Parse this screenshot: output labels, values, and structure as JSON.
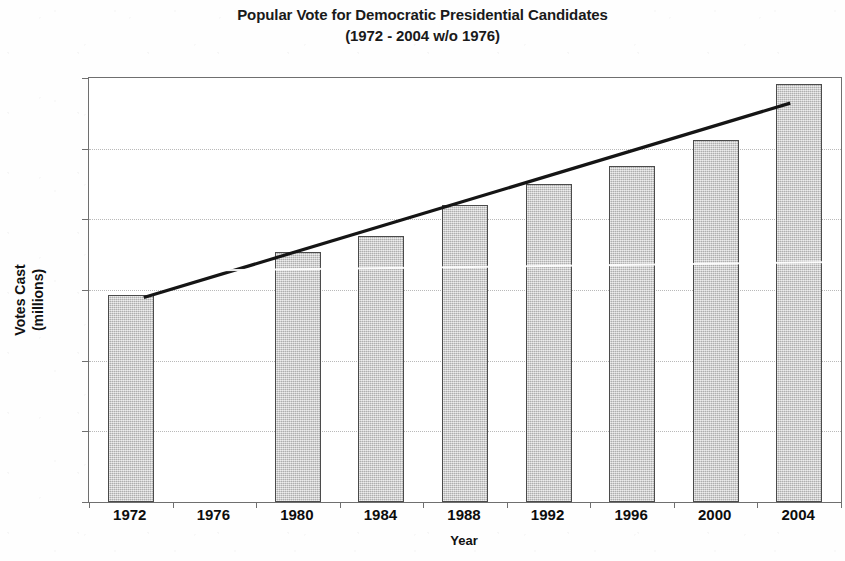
{
  "chart_data": {
    "type": "bar",
    "title": "Popular Vote for Democratic Presidential Candidates",
    "subtitle": "(1972 - 2004 w/o 1976)",
    "xlabel": "Year",
    "ylabel_line1": "Votes Cast",
    "ylabel_line2": "(millions)",
    "categories": [
      "1972",
      "1976",
      "1980",
      "1984",
      "1988",
      "1992",
      "1996",
      "2000",
      "2004"
    ],
    "values": [
      29.3,
      null,
      35.4,
      37.6,
      42.0,
      45.0,
      47.5,
      51.2,
      59.1
    ],
    "ylim": [
      0,
      60
    ],
    "ytick_labels": [
      "0",
      "10",
      "20",
      "30",
      "40",
      "50",
      "60"
    ],
    "ytick_values": [
      0,
      10,
      20,
      30,
      40,
      50,
      60
    ],
    "grid": true,
    "legend": "none",
    "series": [
      {
        "name": "Votes Cast (millions)",
        "type": "bar",
        "values": [
          29.3,
          null,
          35.4,
          37.6,
          42.0,
          45.0,
          47.5,
          51.2,
          59.1
        ]
      },
      {
        "name": "Linear trend",
        "type": "line",
        "start": {
          "x_index": 0,
          "value": 28.8
        },
        "end": {
          "x_index": 8,
          "value": 56.3
        },
        "color": "#151515"
      }
    ],
    "colors": {
      "bar_fill": "#c9c9c9",
      "bar_border": "#4b4b4b",
      "trendline": "#151515",
      "gridline": "#b9b9b9",
      "axis": "#6f6f6f",
      "text": "#0d0d0d",
      "background": "#ffffff"
    }
  }
}
